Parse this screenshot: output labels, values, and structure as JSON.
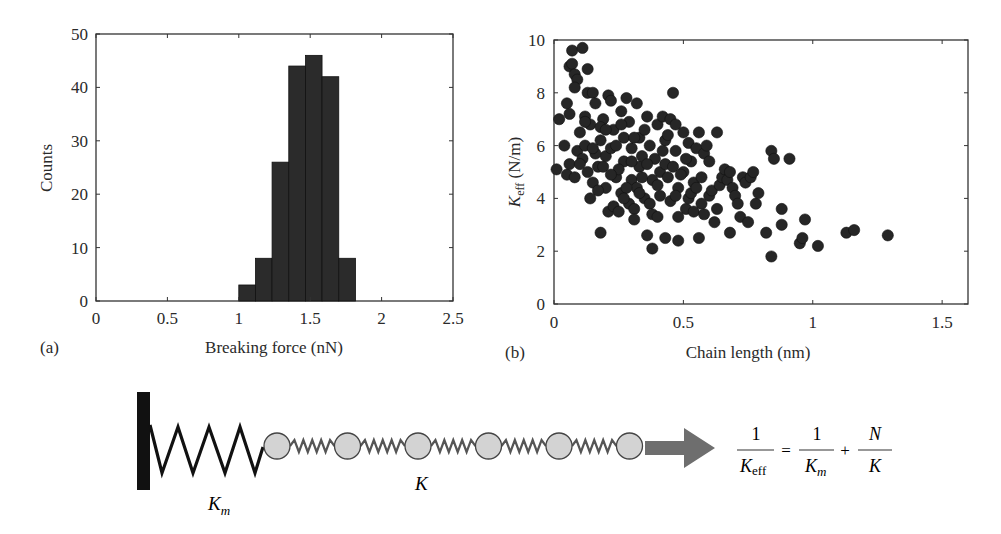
{
  "chart_data": [
    {
      "panel": "(a)",
      "type": "bar",
      "title": "",
      "xlabel": "Breaking force (nN)",
      "ylabel": "Counts",
      "xlim": [
        0,
        2.5
      ],
      "ylim": [
        0,
        50
      ],
      "xticks": [
        "0",
        "0.5",
        "1",
        "1.5",
        "2",
        "2.5"
      ],
      "yticks": [
        "0",
        "10",
        "20",
        "30",
        "40",
        "50"
      ],
      "bin_width": 0.117,
      "bin_edges": [
        1.0,
        1.117,
        1.233,
        1.35,
        1.467,
        1.583,
        1.7,
        1.817
      ],
      "categories": [
        "1.06",
        "1.18",
        "1.29",
        "1.41",
        "1.53",
        "1.64",
        "1.76"
      ],
      "values": [
        3,
        8,
        26,
        44,
        46,
        42,
        8
      ],
      "grid": false,
      "bar_color": "#2b2b2b"
    },
    {
      "panel": "(b)",
      "type": "scatter",
      "title": "",
      "xlabel": "Chain length (nm)",
      "ylabel": "K_eff (N/m)",
      "ylabel_parts": {
        "main": "K",
        "sub": "eff",
        "unit": " (N/m)"
      },
      "xlim": [
        0,
        1.6
      ],
      "ylim": [
        0,
        10
      ],
      "xticks": [
        "0",
        "0.5",
        "1",
        "1.5"
      ],
      "yticks": [
        "0",
        "2",
        "4",
        "6",
        "8",
        "10"
      ],
      "grid": false,
      "marker_color": "#262626",
      "points": [
        [
          0.07,
          9.6
        ],
        [
          0.11,
          9.7
        ],
        [
          0.06,
          9.0
        ],
        [
          0.07,
          9.1
        ],
        [
          0.08,
          8.7
        ],
        [
          0.09,
          8.5
        ],
        [
          0.08,
          8.2
        ],
        [
          0.13,
          8.9
        ],
        [
          0.05,
          7.6
        ],
        [
          0.06,
          7.2
        ],
        [
          0.02,
          7.0
        ],
        [
          0.04,
          6.0
        ],
        [
          0.01,
          5.1
        ],
        [
          0.05,
          4.9
        ],
        [
          0.08,
          4.8
        ],
        [
          0.06,
          5.3
        ],
        [
          0.09,
          5.8
        ],
        [
          0.1,
          6.5
        ],
        [
          0.12,
          7.1
        ],
        [
          0.13,
          8.0
        ],
        [
          0.15,
          8.0
        ],
        [
          0.16,
          7.6
        ],
        [
          0.14,
          6.8
        ],
        [
          0.12,
          6.0
        ],
        [
          0.11,
          5.5
        ],
        [
          0.13,
          5.0
        ],
        [
          0.15,
          4.6
        ],
        [
          0.14,
          4.0
        ],
        [
          0.18,
          2.7
        ],
        [
          0.17,
          5.2
        ],
        [
          0.18,
          6.2
        ],
        [
          0.19,
          7.0
        ],
        [
          0.2,
          5.6
        ],
        [
          0.2,
          4.4
        ],
        [
          0.21,
          7.9
        ],
        [
          0.22,
          7.7
        ],
        [
          0.23,
          6.6
        ],
        [
          0.22,
          5.9
        ],
        [
          0.24,
          4.8
        ],
        [
          0.21,
          3.5
        ],
        [
          0.23,
          3.7
        ],
        [
          0.25,
          3.5
        ],
        [
          0.26,
          4.2
        ],
        [
          0.27,
          5.4
        ],
        [
          0.27,
          6.3
        ],
        [
          0.26,
          7.3
        ],
        [
          0.28,
          7.8
        ],
        [
          0.29,
          6.9
        ],
        [
          0.3,
          5.9
        ],
        [
          0.3,
          4.7
        ],
        [
          0.29,
          3.8
        ],
        [
          0.31,
          3.6
        ],
        [
          0.31,
          3.2
        ],
        [
          0.32,
          4.4
        ],
        [
          0.33,
          5.2
        ],
        [
          0.32,
          7.6
        ],
        [
          0.33,
          6.3
        ],
        [
          0.35,
          4.0
        ],
        [
          0.34,
          5.6
        ],
        [
          0.35,
          6.6
        ],
        [
          0.36,
          7.1
        ],
        [
          0.37,
          6.0
        ],
        [
          0.38,
          4.7
        ],
        [
          0.37,
          3.8
        ],
        [
          0.38,
          3.4
        ],
        [
          0.36,
          2.6
        ],
        [
          0.38,
          2.1
        ],
        [
          0.4,
          3.3
        ],
        [
          0.41,
          4.1
        ],
        [
          0.41,
          5.0
        ],
        [
          0.4,
          6.8
        ],
        [
          0.42,
          7.1
        ],
        [
          0.43,
          6.2
        ],
        [
          0.43,
          5.3
        ],
        [
          0.43,
          2.5
        ],
        [
          0.44,
          4.8
        ],
        [
          0.45,
          3.9
        ],
        [
          0.45,
          7.0
        ],
        [
          0.46,
          8.0
        ],
        [
          0.47,
          6.8
        ],
        [
          0.47,
          5.8
        ],
        [
          0.48,
          4.4
        ],
        [
          0.48,
          2.4
        ],
        [
          0.48,
          3.3
        ],
        [
          0.5,
          6.5
        ],
        [
          0.5,
          5.0
        ],
        [
          0.51,
          3.6
        ],
        [
          0.52,
          4.0
        ],
        [
          0.52,
          6.1
        ],
        [
          0.53,
          5.4
        ],
        [
          0.54,
          4.6
        ],
        [
          0.54,
          3.5
        ],
        [
          0.55,
          5.9
        ],
        [
          0.56,
          6.5
        ],
        [
          0.56,
          2.5
        ],
        [
          0.57,
          4.8
        ],
        [
          0.58,
          3.4
        ],
        [
          0.58,
          5.7
        ],
        [
          0.59,
          6.0
        ],
        [
          0.6,
          4.1
        ],
        [
          0.6,
          5.4
        ],
        [
          0.61,
          4.3
        ],
        [
          0.62,
          3.1
        ],
        [
          0.63,
          3.6
        ],
        [
          0.63,
          6.5
        ],
        [
          0.64,
          4.5
        ],
        [
          0.65,
          4.8
        ],
        [
          0.66,
          5.1
        ],
        [
          0.67,
          4.7
        ],
        [
          0.68,
          2.7
        ],
        [
          0.68,
          5.0
        ],
        [
          0.69,
          4.4
        ],
        [
          0.7,
          4.1
        ],
        [
          0.71,
          3.8
        ],
        [
          0.72,
          3.3
        ],
        [
          0.73,
          4.8
        ],
        [
          0.74,
          4.6
        ],
        [
          0.75,
          3.1
        ],
        [
          0.76,
          4.8
        ],
        [
          0.77,
          5.0
        ],
        [
          0.78,
          3.8
        ],
        [
          0.79,
          4.2
        ],
        [
          0.82,
          2.7
        ],
        [
          0.84,
          1.8
        ],
        [
          0.84,
          5.8
        ],
        [
          0.85,
          5.5
        ],
        [
          0.88,
          3.6
        ],
        [
          0.88,
          3.0
        ],
        [
          0.91,
          5.5
        ],
        [
          0.95,
          2.3
        ],
        [
          0.96,
          2.5
        ],
        [
          0.97,
          3.2
        ],
        [
          1.02,
          2.2
        ],
        [
          1.13,
          2.7
        ],
        [
          1.16,
          2.8
        ],
        [
          1.29,
          2.6
        ],
        [
          0.16,
          5.7
        ],
        [
          0.18,
          6.7
        ],
        [
          0.19,
          5.2
        ],
        [
          0.24,
          6.0
        ],
        [
          0.25,
          5.1
        ],
        [
          0.28,
          4.4
        ],
        [
          0.34,
          4.8
        ],
        [
          0.39,
          5.5
        ],
        [
          0.42,
          5.8
        ],
        [
          0.44,
          6.4
        ],
        [
          0.46,
          5.2
        ],
        [
          0.49,
          4.9
        ],
        [
          0.53,
          4.2
        ],
        [
          0.57,
          3.8
        ],
        [
          0.17,
          4.3
        ],
        [
          0.2,
          6.6
        ],
        [
          0.22,
          4.9
        ],
        [
          0.26,
          6.8
        ],
        [
          0.3,
          5.4
        ],
        [
          0.33,
          4.2
        ],
        [
          0.12,
          6.9
        ],
        [
          0.1,
          5.3
        ],
        [
          0.15,
          5.9
        ],
        [
          0.27,
          4.0
        ],
        [
          0.31,
          6.3
        ],
        [
          0.36,
          5.3
        ],
        [
          0.4,
          4.5
        ],
        [
          0.47,
          4.1
        ],
        [
          0.51,
          5.5
        ],
        [
          0.55,
          4.4
        ]
      ]
    }
  ],
  "panels": {
    "a": {
      "letter": "(a)"
    },
    "b": {
      "letter": "(b)"
    }
  },
  "diagram": {
    "spring_left_label": "K",
    "spring_left_sub": "m",
    "spring_chain_label": "K",
    "bead_count": 6,
    "bead_fill": "#d3d3d3",
    "arrow_color": "#6e6e6e",
    "equation": {
      "lhs_num": "1",
      "lhs_den_main": "K",
      "lhs_den_sub": "eff",
      "equals": "=",
      "t1_num": "1",
      "t1_den_main": "K",
      "t1_den_sub": "m",
      "plus": "+",
      "t2_num": "N",
      "t2_den": "K"
    }
  }
}
